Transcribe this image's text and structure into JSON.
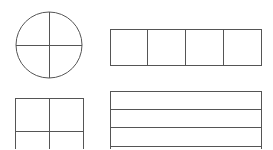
{
  "canvas": {
    "width": 273,
    "height": 149,
    "background": "#ffffff"
  },
  "style": {
    "stroke_color": "#555555"
  },
  "shapes": {
    "circle": {
      "cx": 49,
      "cy": 45,
      "r": 33,
      "divisions": "quadrants"
    },
    "top_rect": {
      "x": 110,
      "y": 29,
      "w": 151,
      "h": 36,
      "columns": 4,
      "dividers_x": [
        147.5,
        185.5,
        223.5
      ]
    },
    "bottom_left_rect": {
      "x": 15,
      "y": 98,
      "w": 68,
      "h": 60,
      "mid_x": 49,
      "mid_y": 131
    },
    "bottom_right_rect": {
      "x": 110,
      "y": 91,
      "w": 151,
      "h": 70,
      "rows_y": [
        109,
        127,
        146
      ]
    }
  }
}
